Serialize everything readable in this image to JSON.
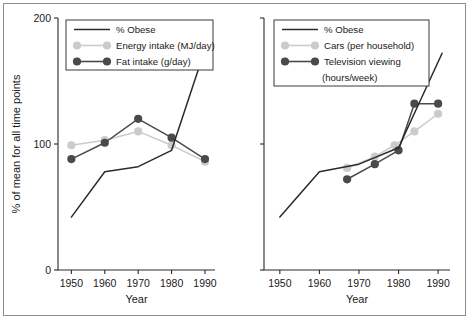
{
  "figure": {
    "panels": [
      "left",
      "right"
    ],
    "y_axis_title": "% of mean for all time points",
    "x_axis_title": "Year",
    "y_ticks": [
      "0",
      "100",
      "200"
    ],
    "x_ticks": [
      "1950",
      "1960",
      "1970",
      "1980",
      "1990"
    ]
  },
  "colors": {
    "obese": "#2b2b2b",
    "light_series": "#cbcbcb",
    "dark_series": "#4a4a4a",
    "axis": "#2b2b2b",
    "frame": "#8d8d8d",
    "background": "#ffffff"
  },
  "chart_data": [
    {
      "type": "line",
      "title": "",
      "panel": "left",
      "xlabel": "Year",
      "ylabel": "% of mean for all time points",
      "xlim": [
        1946,
        1993
      ],
      "ylim": [
        0,
        200
      ],
      "yticks": [
        0,
        100,
        200
      ],
      "xticks": [
        1950,
        1960,
        1970,
        1980,
        1990
      ],
      "grid": false,
      "legend_position": "top-left",
      "series": [
        {
          "name": "% Obese",
          "marker": "none",
          "color": "#2b2b2b",
          "x": [
            1950,
            1960,
            1970,
            1980,
            1990
          ],
          "y": [
            42,
            78,
            82,
            95,
            175
          ]
        },
        {
          "name": "Energy intake (MJ/day)",
          "marker": "circle",
          "color": "#cbcbcb",
          "x": [
            1950,
            1960,
            1970,
            1980,
            1990
          ],
          "y": [
            99,
            103,
            110,
            99,
            86
          ]
        },
        {
          "name": "Fat intake (g/day)",
          "marker": "circle",
          "color": "#4a4a4a",
          "x": [
            1950,
            1960,
            1970,
            1980,
            1990
          ],
          "y": [
            88,
            101,
            120,
            105,
            88
          ]
        }
      ]
    },
    {
      "type": "line",
      "title": "",
      "panel": "right",
      "xlabel": "Year",
      "ylabel": "",
      "xlim": [
        1946,
        1993
      ],
      "ylim": [
        0,
        200
      ],
      "yticks": [
        0,
        100,
        200
      ],
      "xticks": [
        1950,
        1960,
        1970,
        1980,
        1990
      ],
      "grid": false,
      "legend_position": "top-left",
      "series": [
        {
          "name": "% Obese",
          "marker": "none",
          "color": "#2b2b2b",
          "x": [
            1950,
            1960,
            1970,
            1980,
            1991
          ],
          "y": [
            42,
            78,
            84,
            97,
            172
          ]
        },
        {
          "name": "Cars (per household)",
          "marker": "circle",
          "color": "#cbcbcb",
          "x": [
            1967,
            1974,
            1979,
            1984,
            1990
          ],
          "y": [
            81,
            90,
            99,
            110,
            124
          ]
        },
        {
          "name": "Television viewing (hours/week)",
          "marker": "circle",
          "color": "#4a4a4a",
          "x": [
            1967,
            1974,
            1980,
            1984,
            1990
          ],
          "y": [
            72,
            84,
            95,
            132,
            132
          ]
        }
      ]
    }
  ],
  "legends": [
    {
      "panel": "left",
      "entries": [
        {
          "label": "% Obese",
          "style": "line",
          "color": "#2b2b2b"
        },
        {
          "label": "Energy intake (MJ/day)",
          "style": "line-marker",
          "color": "#cbcbcb"
        },
        {
          "label": "Fat intake (g/day)",
          "style": "line-marker",
          "color": "#4a4a4a"
        }
      ]
    },
    {
      "panel": "right",
      "entries": [
        {
          "label": "% Obese",
          "style": "line",
          "color": "#2b2b2b"
        },
        {
          "label": "Cars (per household)",
          "style": "line-marker",
          "color": "#cbcbcb"
        },
        {
          "label": "Television viewing",
          "style": "line-marker",
          "color": "#4a4a4a"
        },
        {
          "label": "(hours/week)",
          "style": "none",
          "color": "#4a4a4a"
        }
      ]
    }
  ]
}
